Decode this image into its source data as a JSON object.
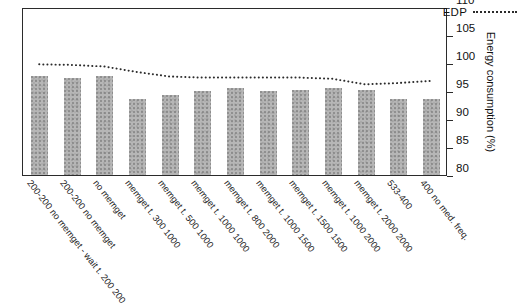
{
  "chart_data": {
    "type": "bar",
    "title": "",
    "xlabel": "",
    "ylabel": "Energy consumption (%)",
    "ylim": [
      80,
      110
    ],
    "yticks": [
      80,
      85,
      90,
      95,
      100,
      105,
      110
    ],
    "grid": false,
    "legend_position": "top-right",
    "categories": [
      "200-200 no memget - wait t. 200 200",
      "200-200 no memget",
      "no memget",
      "memget t. 300 1000",
      "memget t. 500 1000",
      "memget t. 1000 1000",
      "memget t. 800 2000",
      "memget t. 1000 1500",
      "memget t. 1500 1500",
      "memget t. 1000 2000",
      "memget t. 2000 2000",
      "533-400",
      "400 no med. freq."
    ],
    "series": [
      {
        "name": "Energy consumption",
        "type": "bar",
        "values": [
          97.6,
          97.4,
          97.6,
          93.6,
          94.3,
          95.0,
          95.6,
          95.0,
          95.1,
          95.6,
          95.1,
          93.6,
          93.5
        ]
      },
      {
        "name": "EDP",
        "type": "line",
        "style": "dotted",
        "values": [
          100.0,
          99.9,
          99.6,
          98.6,
          97.8,
          97.6,
          97.6,
          97.6,
          97.6,
          97.4,
          96.4,
          96.6,
          97.0
        ]
      }
    ],
    "legend": [
      {
        "label": "EDP",
        "marker": "dotted-line"
      }
    ]
  },
  "axis": {
    "y_title": "Energy consumption (%)",
    "y_tick_labels": [
      "110",
      "105",
      "100",
      "95",
      "90",
      "85",
      "80"
    ]
  },
  "legend_text": {
    "edp": "EDP"
  }
}
